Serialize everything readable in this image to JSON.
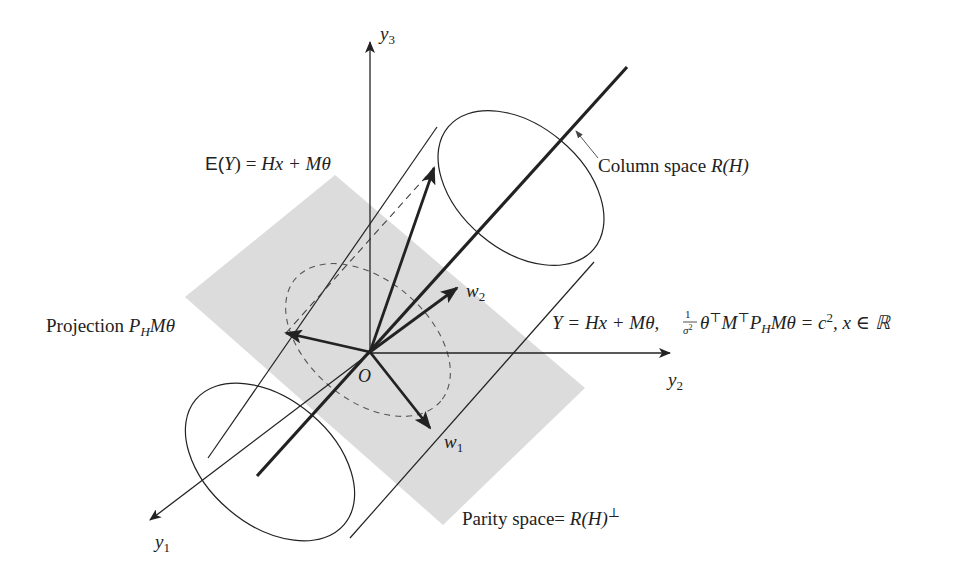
{
  "diagram": {
    "type": "3d-geometry",
    "colors": {
      "ink": "#222222",
      "plane_fill": "#dcdcdc",
      "background": "#ffffff"
    },
    "axes": {
      "y1": {
        "name": "y",
        "sub": "1"
      },
      "y2": {
        "name": "y",
        "sub": "2"
      },
      "y3": {
        "name": "y",
        "sub": "3"
      }
    },
    "origin_label": "O",
    "vectors": {
      "w1": {
        "name": "w",
        "sub": "1"
      },
      "w2": {
        "name": "w",
        "sub": "2"
      }
    },
    "labels": {
      "expectation": {
        "prefix": "E(",
        "var": "Y",
        "mid": ") = ",
        "rhs": "Hx + Mθ"
      },
      "column_space": {
        "text": "Column space ",
        "math": "R(H)"
      },
      "projection": {
        "text": "Projection ",
        "math_p": "P",
        "math_sub": "H",
        "math_rest": "Mθ"
      },
      "cylinder_eq": {
        "part1": "Y = Hx + Mθ,",
        "frac_num": "1",
        "frac_den": "σ",
        "frac_den_sup": "2",
        "part2": "θ",
        "sup_t1": "⊤",
        "part3": "M",
        "sup_t2": "⊤",
        "part4": "P",
        "sub_h": "H",
        "part5": "Mθ = c",
        "sup_2": "2",
        "part6": ", x ∈ ℝ"
      },
      "parity_space": {
        "text": "Parity space= ",
        "math": "R(H)",
        "sup": "⊥"
      }
    }
  }
}
